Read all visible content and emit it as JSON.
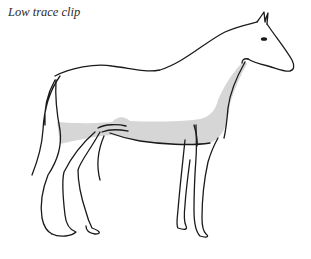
{
  "caption": "Low trace clip",
  "illustration": {
    "subject": "horse-outline",
    "shading_meaning": "clipped-area",
    "colors": {
      "outline": "#1a1a1a",
      "clipped_fill": "#d6d6d6",
      "background": "#ffffff"
    }
  }
}
